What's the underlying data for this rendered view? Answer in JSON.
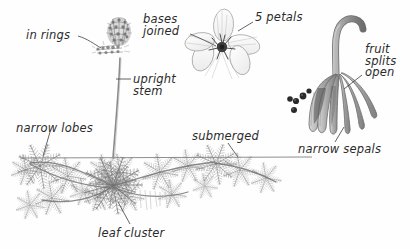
{
  "figure": {
    "background_color": "#fefefe",
    "ink_color": "#4a4a4a",
    "label_color": "#2b2b2b",
    "width": 410,
    "height": 249
  },
  "annotations": [
    {
      "id": "in-rings",
      "text": "in rings",
      "x": 26,
      "y": 30,
      "align": "left"
    },
    {
      "id": "bases-joined",
      "text": "bases\njoined",
      "x": 143,
      "y": 14,
      "align": "left"
    },
    {
      "id": "five-petals",
      "text": "5 petals",
      "x": 255,
      "y": 12,
      "align": "left"
    },
    {
      "id": "upright-stem",
      "text": "upright\nstem",
      "x": 133,
      "y": 74,
      "align": "left"
    },
    {
      "id": "fruit-splits-open",
      "text": "fruit\nsplits\nopen",
      "x": 365,
      "y": 44,
      "align": "left"
    },
    {
      "id": "narrow-lobes",
      "text": "narrow lobes",
      "x": 16,
      "y": 123,
      "align": "left"
    },
    {
      "id": "submerged",
      "text": "submerged",
      "x": 192,
      "y": 131,
      "align": "left"
    },
    {
      "id": "narrow-sepals",
      "text": "narrow sepals",
      "x": 298,
      "y": 144,
      "align": "left"
    },
    {
      "id": "leaf-cluster",
      "text": "leaf cluster",
      "x": 98,
      "y": 228,
      "align": "left"
    }
  ],
  "parts": {
    "flower_spike": "emergent flowering spike with whorled rings of flowers",
    "flower": "five-petalled flower with dark joined center",
    "fruit": "curved fruit splitting open releasing dark seeds",
    "waterline": "horizontal water surface line",
    "submerged_foliage": "feathery whorled submerged leaves on arching stems"
  }
}
